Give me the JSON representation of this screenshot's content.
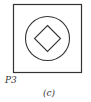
{
  "figure": {
    "label": "P3",
    "caption": "(c)",
    "shapes": [
      "square",
      "circle",
      "diamond"
    ],
    "stroke_color": "#333333"
  }
}
